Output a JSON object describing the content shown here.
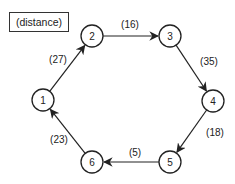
{
  "legend": {
    "label": "(distance)"
  },
  "nodes": [
    {
      "id": "1",
      "label": "1",
      "x": 43,
      "y": 100
    },
    {
      "id": "2",
      "label": "2",
      "x": 92,
      "y": 36
    },
    {
      "id": "3",
      "label": "3",
      "x": 170,
      "y": 36
    },
    {
      "id": "4",
      "label": "4",
      "x": 213,
      "y": 101
    },
    {
      "id": "5",
      "label": "5",
      "x": 170,
      "y": 162
    },
    {
      "id": "6",
      "label": "6",
      "x": 92,
      "y": 162
    }
  ],
  "edges": [
    {
      "from": "1",
      "to": "2",
      "weight": "(27)",
      "label_x": 58,
      "label_y": 59
    },
    {
      "from": "2",
      "to": "3",
      "weight": "(16)",
      "label_x": 130,
      "label_y": 24
    },
    {
      "from": "3",
      "to": "4",
      "weight": "(35)",
      "label_x": 209,
      "label_y": 61
    },
    {
      "from": "4",
      "to": "5",
      "weight": "(18)",
      "label_x": 215,
      "label_y": 132
    },
    {
      "from": "5",
      "to": "6",
      "weight": "(5)",
      "label_x": 135,
      "label_y": 152
    },
    {
      "from": "6",
      "to": "1",
      "weight": "(23)",
      "label_x": 59,
      "label_y": 139
    }
  ],
  "style": {
    "stroke": "#222222",
    "background": "#ffffff",
    "node_radius": 11
  }
}
